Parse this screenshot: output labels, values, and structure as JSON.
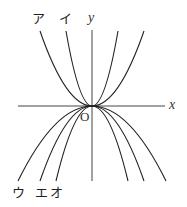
{
  "axes": {
    "x_label": "x",
    "y_label": "y",
    "origin_label": "O"
  },
  "curve_labels": {
    "a": "ア",
    "i": "イ",
    "u": "ウ",
    "e": "エ",
    "o": "オ"
  },
  "colors": {
    "stroke": "#222222",
    "background": "#ffffff"
  }
}
